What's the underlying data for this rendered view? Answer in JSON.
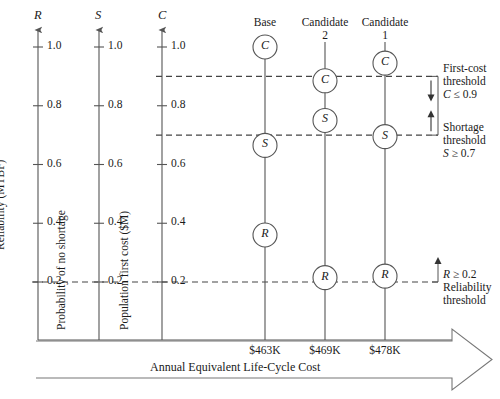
{
  "figure": {
    "caption": "Annual Equivalent Life-Cycle Cost"
  },
  "value_axes": [
    {
      "symbol": "R",
      "title": "Reliability (MTBF)",
      "ticks": [
        "1.0",
        "0.8",
        "0.6",
        "0.4",
        "0.2"
      ]
    },
    {
      "symbol": "S",
      "title": "Probability of no shortage",
      "ticks": [
        "1.0",
        "0.8",
        "0.6",
        "0.4",
        "0.2"
      ]
    },
    {
      "symbol": "C",
      "title": "Population first cost ($M)",
      "ticks": [
        "1.0",
        "0.8",
        "0.6",
        "0.4",
        "0.2"
      ]
    }
  ],
  "alternatives": [
    {
      "name_line1": "Base",
      "name_line2": "",
      "cost": "$463K",
      "markers": [
        {
          "letter": "C",
          "value": 1.0
        },
        {
          "letter": "S",
          "value": 0.665
        },
        {
          "letter": "R",
          "value": 0.36
        }
      ]
    },
    {
      "name_line1": "Candidate",
      "name_line2": "2",
      "cost": "$469K",
      "markers": [
        {
          "letter": "C",
          "value": 0.885
        },
        {
          "letter": "S",
          "value": 0.75
        },
        {
          "letter": "R",
          "value": 0.215
        }
      ]
    },
    {
      "name_line1": "Candidate",
      "name_line2": "1",
      "cost": "$478K",
      "markers": [
        {
          "letter": "C",
          "value": 0.945
        },
        {
          "letter": "S",
          "value": 0.695
        },
        {
          "letter": "R",
          "value": 0.22
        }
      ]
    }
  ],
  "thresholds": [
    {
      "id": "first-cost",
      "line1": "First-cost",
      "line2": "threshold",
      "expr_symbol": "C",
      "expr_rel": " ≤ 0.9",
      "value": 0.9,
      "arrow": "down"
    },
    {
      "id": "shortage",
      "line1": "Shortage",
      "line2": "threshold",
      "expr_symbol": "S",
      "expr_rel": " ≥ 0.7",
      "value": 0.7,
      "arrow": "up"
    },
    {
      "id": "reliability",
      "line1": "Reliability",
      "line2": "threshold",
      "expr_symbol": "R",
      "expr_rel": " ≥ 0.2",
      "value": 0.2,
      "arrow": "up"
    }
  ]
}
